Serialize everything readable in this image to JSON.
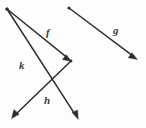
{
  "figure": {
    "background_color": "#fdfdfd",
    "stroke_color": "#2e2e2e",
    "label_color": "#3a3a3a",
    "width": 146,
    "height": 128
  },
  "chart_data": {
    "type": "diagram",
    "xlabel": "",
    "ylabel": "",
    "xlim": [
      0,
      146
    ],
    "ylim": [
      0,
      128
    ],
    "grid": false,
    "legend": "none",
    "vectors": [
      {
        "name": "f",
        "label": "f",
        "start": [
          7,
          9
        ],
        "end": [
          71,
          61
        ],
        "label_pos": [
          46,
          27
        ],
        "arrowhead": "end"
      },
      {
        "name": "k",
        "label": "k",
        "start": [
          7,
          9
        ],
        "end": [
          78,
          119
        ],
        "label_pos": [
          19,
          60
        ],
        "arrowhead": "end"
      },
      {
        "name": "h",
        "label": "h",
        "start": [
          71,
          61
        ],
        "end": [
          12,
          118
        ],
        "label_pos": [
          44,
          95
        ],
        "arrowhead": "end"
      },
      {
        "name": "g",
        "label": "g",
        "start": [
          69,
          8
        ],
        "end": [
          137,
          59
        ],
        "label_pos": [
          113,
          25
        ],
        "arrowhead": "end"
      }
    ]
  },
  "labels": {
    "f": "f",
    "g": "g",
    "h": "h",
    "k": "k"
  }
}
